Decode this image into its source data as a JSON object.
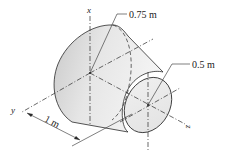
{
  "diagram": {
    "type": "truncated-cone-frustum",
    "axes": {
      "x_label": "x",
      "y_label": "y",
      "z_label": "z"
    },
    "dimensions": {
      "large_radius": "0.75 m",
      "small_radius": "0.5 m",
      "length": "1 m"
    },
    "colors": {
      "stroke": "#2a2a2a",
      "fill_light": "#f2f2f2",
      "fill_dark": "#c4c4c4",
      "face_fill": "#ececec"
    }
  }
}
